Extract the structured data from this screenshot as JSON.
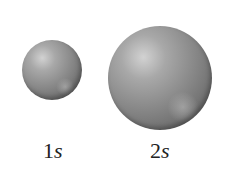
{
  "figure": {
    "orbitals": [
      {
        "name": "1s",
        "number": "1",
        "letter": "s"
      },
      {
        "name": "2s",
        "number": "2",
        "letter": "s"
      }
    ],
    "colors": {
      "sphere_highlight": "#d2d2d2",
      "sphere_mid": "#8c8c8c",
      "sphere_edge": "#505050",
      "label_text": "#222222",
      "background": "#ffffff"
    }
  }
}
